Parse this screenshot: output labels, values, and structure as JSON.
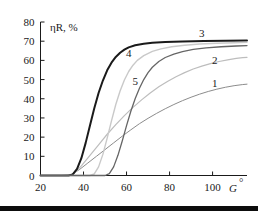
{
  "chart_data": {
    "type": "line",
    "title": "",
    "xlabel": "G°",
    "ylabel": "ηR, %",
    "xlim": [
      20,
      116
    ],
    "ylim": [
      0,
      80
    ],
    "xticks": [
      20,
      40,
      60,
      80,
      100
    ],
    "yticks": [
      0,
      10,
      20,
      30,
      40,
      50,
      60,
      70,
      80
    ],
    "xtick_labels": [
      "20",
      "40",
      "60",
      "80",
      "100"
    ],
    "ytick_labels": [
      "0",
      "10",
      "20",
      "30",
      "40",
      "50",
      "60",
      "70",
      "80"
    ],
    "grid": false,
    "legend": "inline-curve-numbers",
    "series": [
      {
        "name": "1",
        "label": "1",
        "color": "#8c8c8c",
        "width": 1.0,
        "label_x": 101,
        "label_y": 46,
        "points": [
          [
            20,
            0
          ],
          [
            30,
            0
          ],
          [
            34,
            0.3
          ],
          [
            38,
            3.0
          ],
          [
            42,
            6.5
          ],
          [
            46,
            10.0
          ],
          [
            50,
            13.5
          ],
          [
            54,
            17.0
          ],
          [
            58,
            20.5
          ],
          [
            62,
            23.8
          ],
          [
            66,
            27.0
          ],
          [
            70,
            29.8
          ],
          [
            74,
            32.4
          ],
          [
            78,
            34.8
          ],
          [
            82,
            37.0
          ],
          [
            86,
            39.0
          ],
          [
            90,
            40.8
          ],
          [
            94,
            42.4
          ],
          [
            98,
            43.8
          ],
          [
            102,
            45.0
          ],
          [
            106,
            46.0
          ],
          [
            110,
            46.8
          ],
          [
            114,
            47.4
          ],
          [
            116,
            47.6
          ]
        ]
      },
      {
        "name": "2",
        "label": "2",
        "color": "#bdbdbd",
        "width": 1.2,
        "label_x": 101,
        "label_y": 58,
        "points": [
          [
            20,
            0
          ],
          [
            32,
            0
          ],
          [
            35,
            0.5
          ],
          [
            39,
            5.0
          ],
          [
            43,
            10.5
          ],
          [
            47,
            16.0
          ],
          [
            51,
            21.5
          ],
          [
            55,
            26.5
          ],
          [
            59,
            31.2
          ],
          [
            63,
            35.5
          ],
          [
            67,
            39.4
          ],
          [
            71,
            43.0
          ],
          [
            75,
            46.2
          ],
          [
            79,
            49.0
          ],
          [
            83,
            51.5
          ],
          [
            87,
            53.6
          ],
          [
            91,
            55.5
          ],
          [
            95,
            57.0
          ],
          [
            99,
            58.3
          ],
          [
            103,
            59.4
          ],
          [
            107,
            60.3
          ],
          [
            111,
            61.0
          ],
          [
            114,
            61.4
          ],
          [
            116,
            61.6
          ]
        ]
      },
      {
        "name": "3",
        "label": "3",
        "color": "#1a1a1a",
        "width": 2.0,
        "label_x": 95,
        "label_y": 72,
        "points": [
          [
            20,
            0
          ],
          [
            33,
            0
          ],
          [
            35,
            0.6
          ],
          [
            37,
            3.5
          ],
          [
            39,
            9.0
          ],
          [
            41,
            17.0
          ],
          [
            43,
            26.0
          ],
          [
            45,
            35.0
          ],
          [
            47,
            43.0
          ],
          [
            49,
            49.5
          ],
          [
            51,
            54.8
          ],
          [
            53,
            58.8
          ],
          [
            55,
            61.8
          ],
          [
            57,
            64.0
          ],
          [
            59,
            65.6
          ],
          [
            61,
            66.8
          ],
          [
            64,
            67.9
          ],
          [
            68,
            68.7
          ],
          [
            72,
            69.2
          ],
          [
            78,
            69.6
          ],
          [
            86,
            69.9
          ],
          [
            96,
            70.1
          ],
          [
            106,
            70.2
          ],
          [
            116,
            70.3
          ]
        ]
      },
      {
        "name": "4",
        "label": "4",
        "color": "#c9c9c9",
        "width": 1.4,
        "label_x": 61,
        "label_y": 62,
        "points": [
          [
            20,
            0
          ],
          [
            43,
            0
          ],
          [
            45,
            0.8
          ],
          [
            47,
            4.5
          ],
          [
            49,
            11.0
          ],
          [
            51,
            19.5
          ],
          [
            53,
            28.5
          ],
          [
            55,
            37.0
          ],
          [
            57,
            44.0
          ],
          [
            59,
            49.8
          ],
          [
            61,
            54.2
          ],
          [
            63,
            57.5
          ],
          [
            65,
            60.0
          ],
          [
            68,
            62.5
          ],
          [
            72,
            64.7
          ],
          [
            76,
            66.0
          ],
          [
            81,
            67.1
          ],
          [
            87,
            67.9
          ],
          [
            94,
            68.5
          ],
          [
            102,
            68.9
          ],
          [
            110,
            69.2
          ],
          [
            116,
            69.4
          ]
        ]
      },
      {
        "name": "5",
        "label": "5",
        "color": "#666666",
        "width": 1.3,
        "label_x": 64,
        "label_y": 47,
        "points": [
          [
            20,
            0
          ],
          [
            50,
            0
          ],
          [
            52,
            1.0
          ],
          [
            54,
            4.5
          ],
          [
            56,
            10.5
          ],
          [
            58,
            18.0
          ],
          [
            60,
            26.0
          ],
          [
            62,
            33.5
          ],
          [
            64,
            40.0
          ],
          [
            66,
            45.5
          ],
          [
            68,
            50.0
          ],
          [
            70,
            53.6
          ],
          [
            72,
            56.4
          ],
          [
            75,
            59.4
          ],
          [
            78,
            61.5
          ],
          [
            82,
            63.3
          ],
          [
            86,
            64.6
          ],
          [
            91,
            65.7
          ],
          [
            97,
            66.5
          ],
          [
            104,
            67.1
          ],
          [
            111,
            67.5
          ],
          [
            116,
            67.7
          ]
        ]
      }
    ]
  },
  "axes": {
    "y_axis_title": "ηR, %",
    "x_axis_title": "G",
    "x_axis_title_sup": "°"
  },
  "artifact": {
    "name": "scan-bar"
  }
}
